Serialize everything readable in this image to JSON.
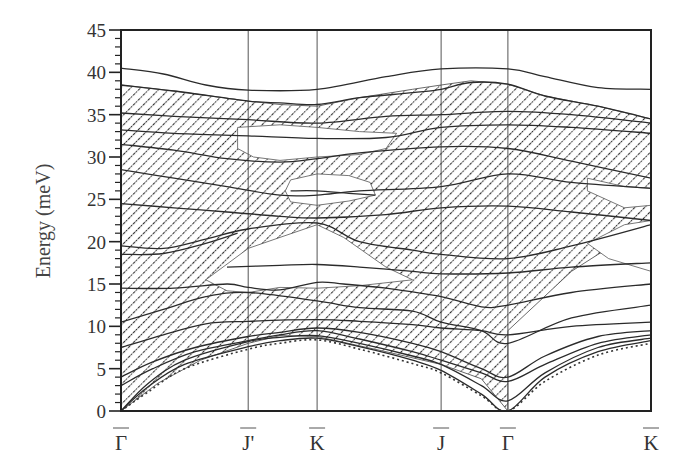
{
  "chart_data": {
    "type": "line",
    "title": "",
    "xlabel": "",
    "ylabel": "Energy (meV)",
    "ylim": [
      0,
      45
    ],
    "xlim": [
      0,
      1
    ],
    "yticks": [
      0,
      5,
      10,
      15,
      20,
      25,
      30,
      35,
      40,
      45
    ],
    "yminor_step": 1,
    "grid": false,
    "legend": "none",
    "high_symmetry_points": [
      {
        "label": "Γ",
        "x": 0.0
      },
      {
        "label": "J'",
        "x": 0.24
      },
      {
        "label": "K",
        "x": 0.37
      },
      {
        "label": "J",
        "x": 0.604
      },
      {
        "label": "Γ",
        "x": 0.73
      },
      {
        "label": "K",
        "x": 1.0
      }
    ],
    "hatched_regions": [
      {
        "name": "bulk-band-projection-main",
        "points": [
          [
            0,
            38.5
          ],
          [
            0.1,
            37.8
          ],
          [
            0.24,
            36.6
          ],
          [
            0.3,
            36.2
          ],
          [
            0.37,
            36.0
          ],
          [
            0.45,
            37.0
          ],
          [
            0.55,
            38.0
          ],
          [
            0.604,
            38.5
          ],
          [
            0.66,
            39.0
          ],
          [
            0.73,
            38.6
          ],
          [
            0.8,
            37.2
          ],
          [
            0.9,
            36.0
          ],
          [
            1.0,
            34.5
          ],
          [
            1.0,
            22.0
          ],
          [
            0.9,
            18.5
          ],
          [
            0.85,
            16.5
          ],
          [
            0.73,
            9.5
          ],
          [
            0.73,
            3.0
          ],
          [
            0.73,
            0.0
          ],
          [
            0.68,
            3.8
          ],
          [
            0.604,
            5.5
          ],
          [
            0.5,
            7.0
          ],
          [
            0.37,
            8.8
          ],
          [
            0.3,
            8.9
          ],
          [
            0.24,
            8.0
          ],
          [
            0.15,
            6.0
          ],
          [
            0.07,
            3.3
          ],
          [
            0.0,
            0.0
          ]
        ]
      }
    ],
    "white_gaps": [
      {
        "name": "gap-upper-jprime-k",
        "points": [
          [
            0.22,
            33.5
          ],
          [
            0.3,
            33.8
          ],
          [
            0.37,
            33.5
          ],
          [
            0.45,
            33.0
          ],
          [
            0.52,
            32.8
          ],
          [
            0.5,
            31.0
          ],
          [
            0.45,
            30.3
          ],
          [
            0.37,
            30.0
          ],
          [
            0.3,
            29.6
          ],
          [
            0.25,
            30.0
          ],
          [
            0.22,
            31.0
          ]
        ]
      },
      {
        "name": "gap-k-25meV",
        "points": [
          [
            0.32,
            27.3
          ],
          [
            0.37,
            28.0
          ],
          [
            0.43,
            27.8
          ],
          [
            0.47,
            27.0
          ],
          [
            0.48,
            25.5
          ],
          [
            0.43,
            24.8
          ],
          [
            0.37,
            24.3
          ],
          [
            0.32,
            24.7
          ],
          [
            0.31,
            26.0
          ]
        ]
      },
      {
        "name": "gap-mid-15meV",
        "points": [
          [
            0.16,
            15.5
          ],
          [
            0.24,
            19.2
          ],
          [
            0.3,
            20.5
          ],
          [
            0.37,
            22.0
          ],
          [
            0.42,
            20.5
          ],
          [
            0.5,
            17.0
          ],
          [
            0.55,
            15.5
          ],
          [
            0.45,
            14.8
          ],
          [
            0.37,
            14.5
          ],
          [
            0.3,
            14.6
          ],
          [
            0.24,
            14.0
          ],
          [
            0.2,
            14.2
          ]
        ]
      },
      {
        "name": "gap-right-upper",
        "points": [
          [
            0.88,
            27.5
          ],
          [
            0.95,
            26.5
          ],
          [
            1.0,
            26.3
          ],
          [
            1.0,
            24.3
          ],
          [
            0.95,
            24.0
          ],
          [
            0.88,
            26.0
          ]
        ]
      },
      {
        "name": "gap-right-lower",
        "points": [
          [
            0.88,
            19.8
          ],
          [
            0.95,
            22.0
          ],
          [
            1.0,
            22.5
          ],
          [
            1.0,
            16.5
          ],
          [
            0.92,
            18.0
          ]
        ]
      }
    ],
    "series": [
      {
        "name": "top-branch-40meV",
        "style": "solid",
        "points": [
          [
            0,
            40.5
          ],
          [
            0.08,
            39.8
          ],
          [
            0.16,
            38.5
          ],
          [
            0.24,
            37.9
          ],
          [
            0.37,
            38.0
          ],
          [
            0.5,
            39.5
          ],
          [
            0.604,
            40.4
          ],
          [
            0.73,
            40.4
          ],
          [
            0.8,
            39.5
          ],
          [
            0.9,
            38.2
          ],
          [
            1.0,
            38.0
          ]
        ]
      },
      {
        "name": "branch-37",
        "style": "solid",
        "points": [
          [
            0,
            38.5
          ],
          [
            0.1,
            37.8
          ],
          [
            0.24,
            36.6
          ],
          [
            0.3,
            36.4
          ],
          [
            0.37,
            36.2
          ],
          [
            0.45,
            37.0
          ],
          [
            0.55,
            37.6
          ],
          [
            0.604,
            38.0
          ],
          [
            0.66,
            38.8
          ],
          [
            0.73,
            38.6
          ],
          [
            0.8,
            37.2
          ],
          [
            0.9,
            36.0
          ],
          [
            1.0,
            34.5
          ]
        ]
      },
      {
        "name": "branch-35",
        "style": "solid",
        "points": [
          [
            0,
            35.2
          ],
          [
            0.1,
            34.8
          ],
          [
            0.24,
            34.4
          ],
          [
            0.37,
            34.0
          ],
          [
            0.5,
            34.8
          ],
          [
            0.604,
            35.0
          ],
          [
            0.73,
            35.4
          ],
          [
            0.85,
            35.0
          ],
          [
            1.0,
            34.0
          ]
        ]
      },
      {
        "name": "branch-33",
        "style": "solid",
        "points": [
          [
            0,
            33.2
          ],
          [
            0.1,
            32.8
          ],
          [
            0.24,
            32.5
          ],
          [
            0.37,
            32.2
          ],
          [
            0.5,
            32.3
          ],
          [
            0.604,
            33.5
          ],
          [
            0.73,
            33.8
          ],
          [
            0.85,
            33.5
          ],
          [
            1.0,
            32.8
          ]
        ]
      },
      {
        "name": "branch-31",
        "style": "solid",
        "points": [
          [
            0,
            31.5
          ],
          [
            0.1,
            30.8
          ],
          [
            0.2,
            29.8
          ],
          [
            0.3,
            29.4
          ],
          [
            0.37,
            29.8
          ],
          [
            0.45,
            30.5
          ],
          [
            0.604,
            31.2
          ],
          [
            0.73,
            31.0
          ],
          [
            0.85,
            29.5
          ],
          [
            1.0,
            27.5
          ]
        ]
      },
      {
        "name": "branch-28",
        "style": "solid",
        "points": [
          [
            0,
            28.5
          ],
          [
            0.1,
            27.5
          ],
          [
            0.2,
            26.5
          ],
          [
            0.3,
            25.5
          ],
          [
            0.37,
            25.5
          ],
          [
            0.45,
            26.0
          ],
          [
            0.604,
            26.5
          ],
          [
            0.73,
            28.0
          ],
          [
            0.85,
            27.0
          ],
          [
            1.0,
            26.3
          ]
        ]
      },
      {
        "name": "branch-26",
        "style": "solid",
        "points": [
          [
            0.32,
            26.0
          ],
          [
            0.37,
            26.0
          ],
          [
            0.43,
            25.7
          ],
          [
            0.48,
            25.5
          ]
        ]
      },
      {
        "name": "branch-24",
        "style": "solid",
        "points": [
          [
            0,
            24.5
          ],
          [
            0.1,
            24.0
          ],
          [
            0.2,
            23.5
          ],
          [
            0.3,
            23.0
          ],
          [
            0.37,
            22.8
          ],
          [
            0.5,
            23.2
          ],
          [
            0.604,
            24.0
          ],
          [
            0.73,
            24.2
          ],
          [
            0.85,
            23.5
          ],
          [
            1.0,
            22.5
          ]
        ]
      },
      {
        "name": "branch-20",
        "style": "solid",
        "points": [
          [
            0,
            19.5
          ],
          [
            0.08,
            19.2
          ],
          [
            0.16,
            20.3
          ],
          [
            0.24,
            21.5
          ],
          [
            0.37,
            22.2
          ],
          [
            0.45,
            20.0
          ],
          [
            0.55,
            19.0
          ],
          [
            0.604,
            18.5
          ],
          [
            0.73,
            18.0
          ],
          [
            0.85,
            19.5
          ],
          [
            1.0,
            22.0
          ]
        ]
      },
      {
        "name": "branch-18",
        "style": "solid",
        "points": [
          [
            0,
            18.5
          ],
          [
            0.08,
            18.6
          ],
          [
            0.16,
            19.8
          ],
          [
            0.22,
            21.0
          ]
        ]
      },
      {
        "name": "branch-17",
        "style": "solid",
        "points": [
          [
            0.2,
            17.0
          ],
          [
            0.3,
            17.2
          ],
          [
            0.37,
            17.3
          ],
          [
            0.45,
            17.0
          ],
          [
            0.55,
            16.5
          ],
          [
            0.604,
            16.2
          ],
          [
            0.73,
            16.3
          ],
          [
            0.85,
            17.0
          ],
          [
            1.0,
            17.5
          ]
        ]
      },
      {
        "name": "branch-15",
        "style": "solid",
        "points": [
          [
            0,
            14.5
          ],
          [
            0.1,
            14.5
          ],
          [
            0.2,
            15.0
          ],
          [
            0.24,
            14.6
          ],
          [
            0.3,
            14.3
          ],
          [
            0.37,
            15.2
          ],
          [
            0.42,
            15.0
          ],
          [
            0.5,
            14.5
          ],
          [
            0.604,
            13.5
          ],
          [
            0.68,
            12.3
          ],
          [
            0.73,
            12.5
          ],
          [
            0.85,
            14.0
          ],
          [
            1.0,
            15.0
          ]
        ]
      },
      {
        "name": "branch-12",
        "style": "solid",
        "points": [
          [
            0,
            10.5
          ],
          [
            0.08,
            12.0
          ],
          [
            0.16,
            13.5
          ],
          [
            0.24,
            14.0
          ],
          [
            0.37,
            13.0
          ],
          [
            0.45,
            12.2
          ],
          [
            0.55,
            11.8
          ],
          [
            0.604,
            10.5
          ],
          [
            0.68,
            9.5
          ],
          [
            0.73,
            8.0
          ],
          [
            0.85,
            11.0
          ],
          [
            1.0,
            12.5
          ]
        ]
      },
      {
        "name": "branch-10",
        "style": "solid",
        "points": [
          [
            0,
            7.5
          ],
          [
            0.08,
            9.0
          ],
          [
            0.16,
            10.3
          ],
          [
            0.24,
            10.6
          ],
          [
            0.37,
            10.8
          ],
          [
            0.45,
            10.6
          ],
          [
            0.55,
            10.2
          ],
          [
            0.604,
            9.8
          ],
          [
            0.68,
            9.5
          ],
          [
            0.73,
            9.0
          ],
          [
            0.85,
            10.0
          ],
          [
            1.0,
            10.5
          ]
        ]
      },
      {
        "name": "branch-8",
        "style": "solid",
        "points": [
          [
            0,
            4.0
          ],
          [
            0.06,
            5.8
          ],
          [
            0.14,
            7.5
          ],
          [
            0.24,
            8.8
          ],
          [
            0.3,
            9.3
          ],
          [
            0.37,
            9.8
          ],
          [
            0.45,
            9.3
          ],
          [
            0.55,
            8.0
          ],
          [
            0.604,
            7.0
          ],
          [
            0.68,
            5.0
          ],
          [
            0.73,
            4.0
          ],
          [
            0.8,
            6.5
          ],
          [
            0.9,
            8.8
          ],
          [
            1.0,
            9.5
          ]
        ]
      },
      {
        "name": "branch-6",
        "style": "solid",
        "points": [
          [
            0,
            3.0
          ],
          [
            0.06,
            5.0
          ],
          [
            0.14,
            7.0
          ],
          [
            0.24,
            8.3
          ],
          [
            0.3,
            9.0
          ],
          [
            0.37,
            9.5
          ],
          [
            0.45,
            8.5
          ],
          [
            0.55,
            7.0
          ],
          [
            0.604,
            6.0
          ],
          [
            0.68,
            4.5
          ],
          [
            0.73,
            3.5
          ],
          [
            0.8,
            5.5
          ],
          [
            0.9,
            8.0
          ],
          [
            1.0,
            9.0
          ]
        ]
      },
      {
        "name": "branch-rayleigh-upper",
        "style": "solid",
        "points": [
          [
            0,
            0.0
          ],
          [
            0.05,
            3.2
          ],
          [
            0.12,
            6.0
          ],
          [
            0.24,
            8.2
          ],
          [
            0.3,
            8.7
          ],
          [
            0.37,
            8.9
          ],
          [
            0.45,
            8.0
          ],
          [
            0.55,
            6.5
          ],
          [
            0.604,
            5.5
          ],
          [
            0.68,
            3.0
          ],
          [
            0.73,
            1.2
          ],
          [
            0.8,
            4.5
          ],
          [
            0.9,
            7.5
          ],
          [
            1.0,
            8.6
          ]
        ]
      },
      {
        "name": "branch-rayleigh",
        "style": "solid",
        "points": [
          [
            0,
            0.0
          ],
          [
            0.05,
            2.8
          ],
          [
            0.12,
            5.5
          ],
          [
            0.24,
            7.6
          ],
          [
            0.3,
            8.3
          ],
          [
            0.37,
            8.6
          ],
          [
            0.45,
            7.6
          ],
          [
            0.55,
            6.0
          ],
          [
            0.604,
            4.8
          ],
          [
            0.68,
            2.0
          ],
          [
            0.73,
            0.0
          ],
          [
            0.8,
            4.0
          ],
          [
            0.9,
            7.0
          ],
          [
            1.0,
            8.3
          ]
        ]
      },
      {
        "name": "surface-mode-dotted",
        "style": "dotted",
        "points": [
          [
            0,
            0.0
          ],
          [
            0.05,
            2.2
          ],
          [
            0.12,
            5.0
          ],
          [
            0.24,
            7.3
          ],
          [
            0.3,
            8.0
          ],
          [
            0.37,
            8.4
          ],
          [
            0.45,
            7.3
          ],
          [
            0.55,
            5.6
          ],
          [
            0.604,
            4.5
          ],
          [
            0.68,
            1.8
          ],
          [
            0.73,
            0.0
          ],
          [
            0.8,
            3.5
          ],
          [
            0.9,
            6.6
          ],
          [
            1.0,
            8.0
          ]
        ]
      }
    ]
  }
}
